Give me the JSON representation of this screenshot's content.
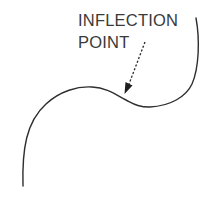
{
  "diagram": {
    "label": {
      "line1": "INFLECTION",
      "line2": "POINT"
    },
    "colors": {
      "curve": "#2e2e2e",
      "text": "#3a3a3a",
      "arrow": "#2a2a2a",
      "background": "#ffffff"
    },
    "elements": {
      "curve": "S-shaped curve with a local maximum and a local minimum",
      "arrow": "dashed arrow pointing from label to inflection point on curve"
    }
  }
}
